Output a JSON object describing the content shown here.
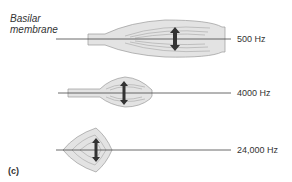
{
  "title_label": {
    "line1": "Basilar",
    "line2": "membrane"
  },
  "panel_label": "(c)",
  "rows": [
    {
      "frequency": "500 Hz"
    },
    {
      "frequency": "4000 Hz"
    },
    {
      "frequency": "24,000 Hz"
    }
  ],
  "colors": {
    "fill": "#e3e3e3",
    "stroke": "#888888",
    "line": "#444444",
    "arrow": "#333333"
  }
}
